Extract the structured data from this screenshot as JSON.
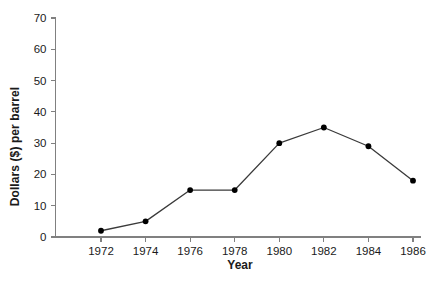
{
  "chart_data": {
    "type": "line",
    "title": "",
    "xlabel": "Year",
    "ylabel": "Dollars ($) per barrel",
    "categories": [
      1972,
      1974,
      1976,
      1978,
      1980,
      1982,
      1984,
      1986
    ],
    "x": [
      1972,
      1974,
      1976,
      1978,
      1980,
      1982,
      1984,
      1986
    ],
    "values": [
      2,
      5,
      15,
      15,
      30,
      35,
      29,
      18
    ],
    "series": [
      {
        "name": "Oil price",
        "values": [
          2,
          5,
          15,
          15,
          30,
          35,
          29,
          18
        ]
      }
    ],
    "xlim": [
      1971,
      1987
    ],
    "ylim": [
      0,
      70
    ],
    "ytick_labels": [
      "0",
      "10",
      "20",
      "30",
      "40",
      "50",
      "60",
      "70"
    ],
    "yticks": [
      0,
      10,
      20,
      30,
      40,
      50,
      60,
      70
    ],
    "xtick_labels": [
      "1972",
      "1974",
      "1976",
      "1978",
      "1980",
      "1982",
      "1984",
      "1986"
    ],
    "xticks": [
      1972,
      1974,
      1976,
      1978,
      1980,
      1982,
      1984,
      1986
    ],
    "grid": false,
    "legend": false,
    "legend_position": "none",
    "marker": "filled-circle",
    "colors": {
      "background": "#ffffff",
      "line": "#3a3a3a",
      "marker": "#000000",
      "axis": "#808080",
      "text": "#1a1a1a"
    }
  },
  "axes": {
    "y_title": "Dollars ($) per barrel",
    "x_title": "Year"
  }
}
